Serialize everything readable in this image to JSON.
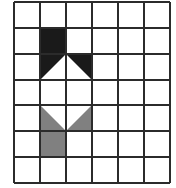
{
  "figure": {
    "title": "",
    "kind": "grid-pattern",
    "background_color": "#ffffff",
    "width": 176,
    "height": 188
  },
  "grid": {
    "columns": 6,
    "rows": 7,
    "line_color": "#2b2b2b",
    "line_width": 1.6,
    "x_positions": [
      14,
      40,
      66,
      92,
      118,
      144,
      170
    ],
    "y_positions": [
      2,
      28,
      54,
      80,
      105,
      131,
      157,
      183
    ]
  },
  "palette": {
    "black": "#1a1a1a",
    "gray": "#808080",
    "white": "#ffffff"
  },
  "shapes": [
    {
      "name": "black-square",
      "color_key": "black",
      "color": "#1a1a1a",
      "cell": {
        "col": 1,
        "row": 1
      },
      "fill_type": "full-square",
      "points": "40,28 66,28 66,54 40,54"
    },
    {
      "name": "black-triangle-left",
      "color_key": "black",
      "color": "#1a1a1a",
      "cell": {
        "col": 1,
        "row": 2
      },
      "fill_type": "upper-left-triangle",
      "points": "40,54 66,54 40,80"
    },
    {
      "name": "black-triangle-right",
      "color_key": "black",
      "color": "#1a1a1a",
      "cell": {
        "col": 2,
        "row": 2
      },
      "fill_type": "upper-right-triangle",
      "points": "66,54 92,54 92,80"
    },
    {
      "name": "gray-triangle-left",
      "color_key": "gray",
      "color": "#808080",
      "cell": {
        "col": 1,
        "row": 4
      },
      "fill_type": "lower-left-triangle",
      "points": "40,105 40,131 66,131"
    },
    {
      "name": "gray-triangle-right",
      "color_key": "gray",
      "color": "#808080",
      "cell": {
        "col": 2,
        "row": 4
      },
      "fill_type": "lower-right-triangle",
      "points": "92,105 92,131 66,131"
    },
    {
      "name": "gray-square",
      "color_key": "gray",
      "color": "#808080",
      "cell": {
        "col": 1,
        "row": 5
      },
      "fill_type": "full-square",
      "points": "40,131 66,131 66,157 40,157"
    }
  ]
}
